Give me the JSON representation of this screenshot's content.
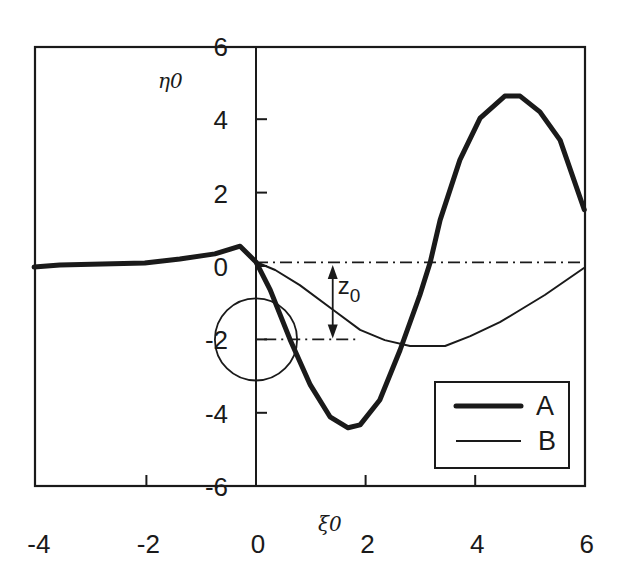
{
  "chart_data": {
    "type": "line",
    "title": "",
    "xlabel": "ξ0",
    "ylabel": "η0",
    "xlim": [
      -4,
      6
    ],
    "ylim": [
      -6,
      6
    ],
    "grid": false,
    "x_ticks": [
      -4,
      -2,
      0,
      2,
      4,
      6
    ],
    "y_ticks": [
      6,
      4,
      2,
      0,
      -2,
      -4,
      -6
    ],
    "x_tick_labels": [
      "-4",
      "-2",
      "0",
      "2",
      "4",
      "6"
    ],
    "y_tick_labels": [
      "6",
      "4",
      "2",
      "0",
      "-2",
      "-4",
      "-6"
    ],
    "legend_position": "lower right",
    "series": [
      {
        "name": "A",
        "style": "thick",
        "x": [
          -4.05,
          -3.58,
          -2.03,
          -1.39,
          -0.75,
          -0.29,
          0.0,
          0.26,
          0.62,
          0.99,
          1.35,
          1.68,
          1.9,
          2.26,
          2.63,
          2.99,
          3.18,
          3.36,
          3.72,
          4.09,
          4.54,
          4.82,
          5.18,
          5.55,
          5.99
        ],
        "y": [
          -0.03,
          0.03,
          0.08,
          0.19,
          0.33,
          0.54,
          0.11,
          -0.65,
          -2.0,
          -3.24,
          -4.11,
          -4.41,
          -4.33,
          -3.65,
          -2.29,
          -0.79,
          0.11,
          1.25,
          2.89,
          4.03,
          4.63,
          4.63,
          4.2,
          3.43,
          1.53
        ]
      },
      {
        "name": "B",
        "style": "thin",
        "x": [
          0.0,
          0.35,
          0.8,
          1.41,
          1.9,
          2.35,
          2.81,
          3.45,
          3.91,
          4.45,
          4.82,
          5.27,
          5.99
        ],
        "y": [
          0.11,
          -0.11,
          -0.52,
          -1.2,
          -1.74,
          -2.02,
          -2.18,
          -2.18,
          -1.91,
          -1.53,
          -1.2,
          -0.79,
          -0.05
        ]
      }
    ],
    "annotations": {
      "z0_label": "z",
      "z0_subscript": "0",
      "z0_arrow": {
        "x": 1.4,
        "y_from": 0.0,
        "y_to": -2.0
      },
      "upper_dashdot_line": {
        "y": 0.1,
        "x_from": 0.0,
        "x_to": 6.0
      },
      "lower_dashdot_line": {
        "y": -2.0,
        "x_from": 0.15,
        "x_to": 1.9
      },
      "circle": {
        "cx": 0.0,
        "cy": -2.0,
        "r_x_units": 0.75,
        "r_y_units": 1.12
      }
    }
  },
  "colors": {
    "ink": "#1a1a1a",
    "background": "#ffffff"
  }
}
